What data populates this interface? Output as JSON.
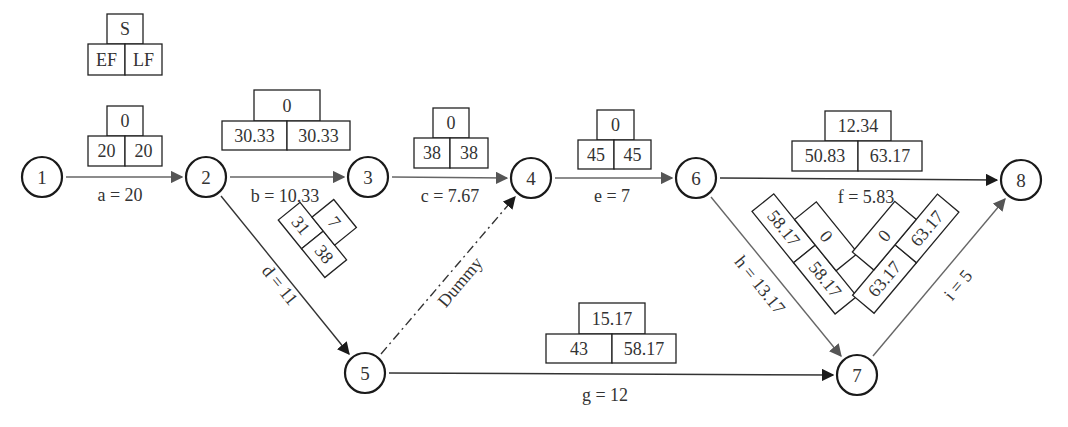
{
  "legend": {
    "top": "S",
    "left": "EF",
    "right": "LF"
  },
  "nodes": [
    {
      "id": "1",
      "x": 42,
      "y": 177
    },
    {
      "id": "2",
      "x": 206,
      "y": 177
    },
    {
      "id": "3",
      "x": 368,
      "y": 177
    },
    {
      "id": "4",
      "x": 531,
      "y": 178
    },
    {
      "id": "5",
      "x": 365,
      "y": 373
    },
    {
      "id": "6",
      "x": 696,
      "y": 178
    },
    {
      "id": "7",
      "x": 857,
      "y": 375
    },
    {
      "id": "8",
      "x": 1021,
      "y": 180
    }
  ],
  "activities": {
    "a": {
      "label": "a = 20",
      "from": "1",
      "to": "2",
      "slack": "0",
      "ef": "20",
      "lf": "20"
    },
    "b": {
      "label": "b = 10.33",
      "from": "2",
      "to": "3",
      "slack": "0",
      "ef": "30.33",
      "lf": "30.33"
    },
    "c": {
      "label": "c = 7.67",
      "from": "3",
      "to": "4",
      "slack": "0",
      "ef": "38",
      "lf": "38"
    },
    "d": {
      "label": "d = 11",
      "from": "2",
      "to": "5",
      "slack": "7",
      "ef": "31",
      "lf": "38"
    },
    "dummy": {
      "label": "Dummy",
      "from": "5",
      "to": "4"
    },
    "e": {
      "label": "e = 7",
      "from": "4",
      "to": "6",
      "slack": "0",
      "ef": "45",
      "lf": "45"
    },
    "f": {
      "label": "f = 5.83",
      "from": "6",
      "to": "8",
      "slack": "12.34",
      "ef": "50.83",
      "lf": "63.17"
    },
    "g": {
      "label": "g = 12",
      "from": "5",
      "to": "7",
      "slack": "15.17",
      "ef": "43",
      "lf": "58.17"
    },
    "h": {
      "label": "h = 13.17",
      "from": "6",
      "to": "7",
      "slack": "0",
      "ef": "58.17",
      "lf": "58.17"
    },
    "i": {
      "label": "i = 5",
      "from": "7",
      "to": "8",
      "slack": "0",
      "ef": "63.17",
      "lf": "63.17"
    }
  }
}
